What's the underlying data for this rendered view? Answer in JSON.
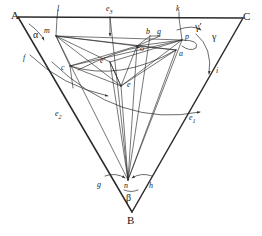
{
  "figure": {
    "type": "geometric-diagram",
    "stroke_color": "#2b2b2b",
    "background": "#ffffff",
    "vertices": [
      {
        "name": "A",
        "label": "A",
        "x": 18,
        "y": 17
      },
      {
        "name": "C",
        "label": "C",
        "x": 243,
        "y": 18
      },
      {
        "name": "B",
        "label": "B",
        "x": 132,
        "y": 213
      }
    ],
    "angles": [
      {
        "name": "alpha",
        "label": "α",
        "x": 33,
        "y": 34,
        "at_vertex": "A"
      },
      {
        "name": "beta",
        "label": "β",
        "x": 126,
        "y": 196,
        "at_vertex": "B"
      },
      {
        "name": "gamma",
        "label": "γ",
        "x": 212,
        "y": 36,
        "at_vertex": "C"
      },
      {
        "name": "gamma-prime",
        "label": "γ′",
        "x": 196,
        "y": 27,
        "at_vertex": "C"
      }
    ],
    "points": [
      {
        "name": "m",
        "label": "m",
        "x": 47,
        "y": 30,
        "px": 56,
        "py": 36
      },
      {
        "name": "o",
        "label": "o",
        "x": 140,
        "y": 48,
        "px": 137,
        "py": 46
      },
      {
        "name": "p",
        "label": "p",
        "x": 184,
        "y": 36,
        "px": 182,
        "py": 40
      },
      {
        "name": "e",
        "label": "e",
        "x": 128,
        "y": 84,
        "px": 121,
        "py": 86
      },
      {
        "name": "e-prime",
        "label": "e′",
        "x": 102,
        "y": 60,
        "px": 110,
        "py": 62
      },
      {
        "name": "c",
        "label": "c",
        "x": 62,
        "y": 67,
        "px": 70,
        "py": 66
      },
      {
        "name": "n",
        "label": "n",
        "x": 124,
        "y": 185,
        "px": 128,
        "py": 180
      },
      {
        "name": "a",
        "label": "a",
        "x": 178,
        "y": 53,
        "px": 176,
        "py": 50
      },
      {
        "name": "b",
        "label": "b",
        "x": 146,
        "y": 31,
        "px": 150,
        "py": 36
      },
      {
        "name": "g-upper",
        "label": "g",
        "x": 156,
        "y": 31,
        "px": 160,
        "py": 36
      },
      {
        "name": "g-lower",
        "label": "g",
        "x": 98,
        "y": 182,
        "px": 104,
        "py": 180
      },
      {
        "name": "h",
        "label": "h",
        "x": 146,
        "y": 185,
        "px": 150,
        "py": 180
      },
      {
        "name": "l",
        "label": "l",
        "x": 56,
        "y": 9,
        "px": 58,
        "py": 17
      },
      {
        "name": "k",
        "label": "k",
        "x": 177,
        "y": 9,
        "px": 179,
        "py": 18
      },
      {
        "name": "f",
        "label": "f",
        "x": 24,
        "y": 57,
        "px": 31,
        "py": 55
      },
      {
        "name": "i",
        "label": "i",
        "x": 216,
        "y": 70,
        "px": 214,
        "py": 68
      },
      {
        "name": "e1",
        "label": "e",
        "sub": "1",
        "x": 189,
        "y": 118
      },
      {
        "name": "e2",
        "label": "e",
        "sub": "2",
        "x": 56,
        "y": 114
      },
      {
        "name": "e3",
        "label": "e",
        "sub": "3",
        "x": 107,
        "y": 9
      }
    ]
  }
}
